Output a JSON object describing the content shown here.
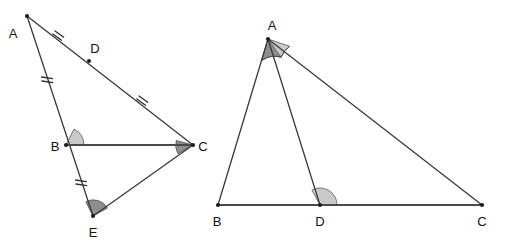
{
  "figure": {
    "background_color": "#ffffff",
    "line_color": "#3a3a3a",
    "label_color": "#121212",
    "angle_light_color": "#c9c9c9",
    "angle_dark_color": "#8e8e8e"
  },
  "left_figure": {
    "name": "triangle-ace-with-cevian-bc",
    "points": {
      "A": {
        "label": "A",
        "x": 27,
        "y": 16,
        "label_x": 13,
        "label_y": 38
      },
      "D": {
        "label": "D",
        "x": 89,
        "y": 61,
        "label_x": 93,
        "label_y": 57
      },
      "B": {
        "label": "B",
        "x": 66,
        "y": 145,
        "label_x": 52,
        "label_y": 152
      },
      "C": {
        "label": "C",
        "x": 193,
        "y": 145,
        "label_x": 199,
        "label_y": 152
      },
      "E": {
        "label": "E",
        "x": 93,
        "y": 216,
        "label_x": 88,
        "label_y": 236
      }
    },
    "segments": [
      {
        "name": "segment-a-to-c",
        "from": "A",
        "to": "C"
      },
      {
        "name": "segment-a-to-e",
        "from": "A",
        "to": "E"
      },
      {
        "name": "segment-b-to-c",
        "from": "B",
        "to": "C"
      },
      {
        "name": "segment-e-to-c",
        "from": "E",
        "to": "C"
      }
    ],
    "tick_marks": [
      {
        "name": "tick-segment-ad",
        "x": 58,
        "y": 38,
        "count": 2,
        "angle": 36
      },
      {
        "name": "tick-segment-dc",
        "x": 142,
        "y": 103,
        "count": 2,
        "angle": 36
      },
      {
        "name": "tick-segment-ab",
        "x": 47,
        "y": 79,
        "count": 1,
        "angle": 75
      },
      {
        "name": "tick-segment-be",
        "x": 81,
        "y": 182,
        "count": 1,
        "angle": 75
      }
    ],
    "angle_markers": [
      {
        "name": "angle-marker-b",
        "vertex": "B",
        "shade": "light",
        "radius": 17
      },
      {
        "name": "angle-marker-c",
        "vertex": "C",
        "shade": "dark",
        "radius": 17
      },
      {
        "name": "angle-marker-e",
        "vertex": "E",
        "shade": "dark",
        "radius": 16
      }
    ]
  },
  "right_figure": {
    "name": "triangle-abc-with-cevian-ad",
    "points": {
      "A": {
        "label": "A",
        "x": 268,
        "y": 39,
        "label_x": 269,
        "label_y": 32
      },
      "B": {
        "label": "B",
        "x": 218,
        "y": 205,
        "label_x": 212,
        "label_y": 223
      },
      "D": {
        "label": "D",
        "x": 320,
        "y": 205,
        "label_x": 314,
        "label_y": 223
      },
      "C": {
        "label": "C",
        "x": 482,
        "y": 205,
        "label_x": 477,
        "label_y": 223
      }
    },
    "segments": [
      {
        "name": "segment-a-to-b",
        "from": "A",
        "to": "B"
      },
      {
        "name": "segment-a-to-d",
        "from": "A",
        "to": "D"
      },
      {
        "name": "segment-a-to-c",
        "from": "A",
        "to": "C"
      },
      {
        "name": "segment-b-to-c",
        "from": "B",
        "to": "C"
      }
    ],
    "angle_markers": [
      {
        "name": "angle-marker-bad",
        "vertex": "A",
        "shade": "dark",
        "radius": 22
      },
      {
        "name": "angle-marker-dac",
        "vertex": "A",
        "shade": "light",
        "radius": 22
      },
      {
        "name": "angle-marker-adc",
        "vertex": "D",
        "shade": "light",
        "radius": 17
      }
    ]
  },
  "stray_marks": [
    {
      "name": "partial-c-glyph-left-edge",
      "label": "C",
      "x": 199,
      "y": 147
    }
  ]
}
